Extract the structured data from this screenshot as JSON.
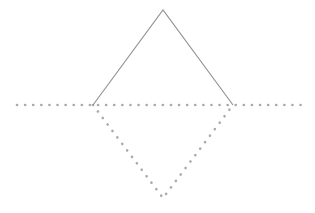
{
  "canvas": {
    "width": 315,
    "height": 213,
    "background": "#ffffff",
    "title": "Reflected triangle over a dotted axis line"
  },
  "style": {
    "solid_stroke_color": "#8f8f96",
    "solid_stroke_width": 1.1,
    "dotted_stroke_color": "#a9a9b0",
    "dotted_stroke_width": 2.6,
    "dot_dash_pattern": "0.1 8",
    "dot_linecap": "round"
  },
  "points": {
    "apex_top": {
      "label": "top vertex",
      "x": 163,
      "y": 10
    },
    "left_vertex": {
      "label": "left vertex",
      "x": 93,
      "y": 105
    },
    "right_vertex": {
      "label": "right vertex",
      "x": 233,
      "y": 105
    },
    "apex_bottom": {
      "label": "bottom vertex",
      "x": 163,
      "y": 198
    },
    "axis_left_end": {
      "label": "axis left end",
      "x": 17,
      "y": 105
    },
    "axis_right_end": {
      "label": "axis right end",
      "x": 301,
      "y": 105
    }
  },
  "shapes": {
    "upper_triangle": {
      "name": "upper-triangle",
      "stroke_style": "solid",
      "edges": [
        {
          "name": "upper-left-edge",
          "from": "left_vertex",
          "to": "apex_top"
        },
        {
          "name": "upper-right-edge",
          "from": "apex_top",
          "to": "right_vertex"
        }
      ]
    },
    "lower_triangle": {
      "name": "lower-triangle",
      "stroke_style": "dotted",
      "edges": [
        {
          "name": "lower-left-edge",
          "from": "left_vertex",
          "to": "apex_bottom"
        },
        {
          "name": "lower-right-edge",
          "from": "apex_bottom",
          "to": "right_vertex"
        }
      ]
    },
    "axis_line": {
      "name": "horizontal-axis-line",
      "stroke_style": "dotted",
      "from": "axis_left_end",
      "to": "axis_right_end"
    }
  },
  "chart_data": {
    "type": "scatter",
    "xlabel": "",
    "ylabel": "",
    "xlim": [
      0,
      315
    ],
    "ylim": [
      0,
      213
    ],
    "grid": false,
    "legend": "none",
    "series": [
      {
        "name": "upper triangle (solid)",
        "style": "solid",
        "x": [
          93,
          163,
          233
        ],
        "y": [
          105,
          10,
          105
        ]
      },
      {
        "name": "lower triangle (dotted)",
        "style": "dotted",
        "x": [
          93,
          163,
          233
        ],
        "y": [
          105,
          198,
          105
        ]
      },
      {
        "name": "horizontal axis (dotted)",
        "style": "dotted",
        "x": [
          17,
          301
        ],
        "y": [
          105,
          105
        ]
      }
    ]
  }
}
